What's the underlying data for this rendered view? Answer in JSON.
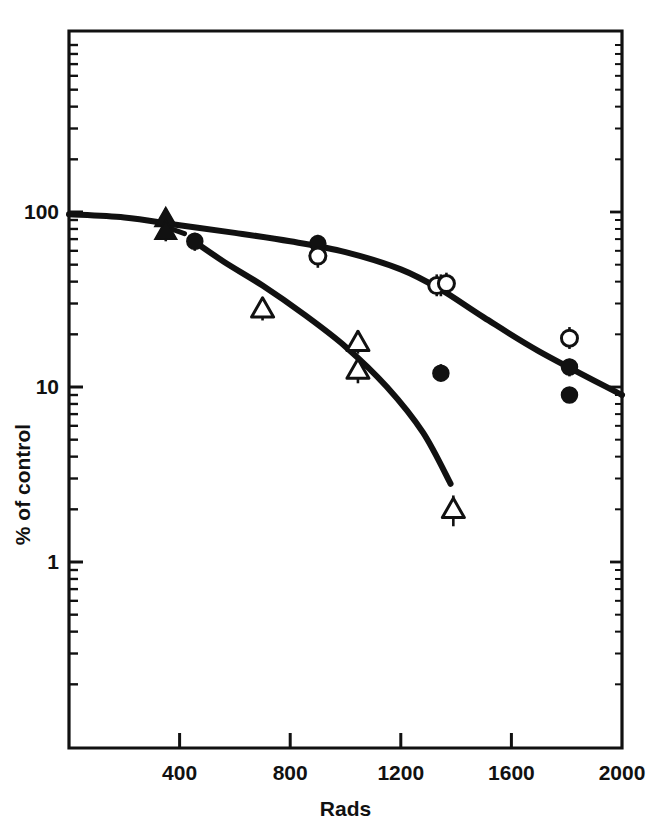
{
  "chart_data": {
    "type": "scatter",
    "title": "",
    "subtitle": "",
    "xlabel": "Rads",
    "ylabel": "% of control",
    "xlim": [
      0,
      2000
    ],
    "ylim": [
      0.35,
      300
    ],
    "yscale": "log",
    "xscale": "linear",
    "grid": false,
    "legend": "none",
    "xticks": [
      400,
      800,
      1200,
      1600,
      2000
    ],
    "xtick_labels": [
      "400",
      "800",
      "1200",
      "1600",
      "2000"
    ],
    "yticks": [
      1,
      10,
      100
    ],
    "ytick_labels": [
      "1",
      "10",
      "100"
    ],
    "series": [
      {
        "name": "filled-triangle",
        "marker": "filled-triangle",
        "points": [
          {
            "x": 350,
            "y": 92,
            "yerr_low": 80,
            "yerr_high": 105
          },
          {
            "x": 350,
            "y": 78,
            "yerr_low": 68,
            "yerr_high": 90
          }
        ]
      },
      {
        "name": "filled-circle",
        "marker": "filled-circle",
        "points": [
          {
            "x": 455,
            "y": 68,
            "yerr_low": 60,
            "yerr_high": 76
          },
          {
            "x": 900,
            "y": 66,
            "yerr_low": 58,
            "yerr_high": 74
          },
          {
            "x": 1345,
            "y": 38,
            "yerr_low": 33,
            "yerr_high": 44
          },
          {
            "x": 1345,
            "y": 12,
            "yerr_low": 11,
            "yerr_high": 13.5
          },
          {
            "x": 1810,
            "y": 13,
            "yerr_low": 11.5,
            "yerr_high": 14.5
          },
          {
            "x": 1810,
            "y": 9,
            "yerr_low": 8.2,
            "yerr_high": 10
          }
        ]
      },
      {
        "name": "open-circle",
        "marker": "open-circle",
        "points": [
          {
            "x": 900,
            "y": 56,
            "yerr_low": 48,
            "yerr_high": 63
          },
          {
            "x": 1330,
            "y": 38,
            "yerr_low": 33,
            "yerr_high": 44
          },
          {
            "x": 1365,
            "y": 39,
            "yerr_low": 34,
            "yerr_high": 45
          },
          {
            "x": 1810,
            "y": 19,
            "yerr_low": 16.5,
            "yerr_high": 22
          }
        ]
      },
      {
        "name": "open-triangle",
        "marker": "open-triangle",
        "points": [
          {
            "x": 700,
            "y": 28,
            "yerr_low": 24,
            "yerr_high": 32
          },
          {
            "x": 1045,
            "y": 18,
            "yerr_low": 15.5,
            "yerr_high": 21
          },
          {
            "x": 1045,
            "y": 12.5,
            "yerr_low": 10.5,
            "yerr_high": 14.5
          },
          {
            "x": 1390,
            "y": 2.0,
            "yerr_low": 1.6,
            "yerr_high": 2.4
          }
        ]
      }
    ],
    "curves": [
      {
        "name": "upper-curve",
        "style": "solid",
        "points": [
          {
            "x": 0,
            "y": 97
          },
          {
            "x": 200,
            "y": 93
          },
          {
            "x": 400,
            "y": 84
          },
          {
            "x": 600,
            "y": 76
          },
          {
            "x": 800,
            "y": 68
          },
          {
            "x": 1000,
            "y": 59
          },
          {
            "x": 1200,
            "y": 47
          },
          {
            "x": 1345,
            "y": 36
          },
          {
            "x": 1500,
            "y": 25
          },
          {
            "x": 1700,
            "y": 16
          },
          {
            "x": 2000,
            "y": 9
          }
        ]
      },
      {
        "name": "lower-curve",
        "style": "solid",
        "points": [
          {
            "x": 440,
            "y": 70
          },
          {
            "x": 560,
            "y": 52
          },
          {
            "x": 700,
            "y": 38
          },
          {
            "x": 850,
            "y": 26
          },
          {
            "x": 1000,
            "y": 17
          },
          {
            "x": 1150,
            "y": 10
          },
          {
            "x": 1280,
            "y": 5.5
          },
          {
            "x": 1380,
            "y": 2.8
          }
        ]
      },
      {
        "name": "dash-segment",
        "style": "dashed",
        "points": [
          {
            "x": 370,
            "y": 80
          },
          {
            "x": 430,
            "y": 74
          }
        ]
      }
    ],
    "colors": {
      "line": "#111111",
      "marker_fill": "#111111",
      "marker_open": "#ffffff",
      "axis": "#111111",
      "background": "#ffffff"
    }
  }
}
